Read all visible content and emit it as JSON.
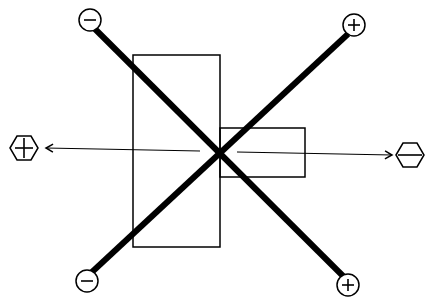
{
  "diagram": {
    "title": "",
    "elements": {
      "large_rect": {
        "x": 133,
        "y": 55,
        "w": 87,
        "h": 192
      },
      "small_rect": {
        "x": 220,
        "y": 128,
        "w": 85,
        "h": 49
      },
      "center": {
        "x": 219,
        "y": 152
      },
      "thick_lines": [
        {
          "from": "top-left",
          "to": "bottom-right",
          "start_symbol": "minus",
          "end_symbol": "plus"
        },
        {
          "from": "bottom-left",
          "to": "top-right",
          "start_symbol": "minus",
          "end_symbol": "plus"
        }
      ],
      "terminals": [
        {
          "id": "top-left",
          "shape": "circle",
          "symbol": "−",
          "x": 90,
          "y": 20
        },
        {
          "id": "top-right",
          "shape": "circle",
          "symbol": "+",
          "x": 354,
          "y": 25
        },
        {
          "id": "bottom-left",
          "shape": "circle",
          "symbol": "−",
          "x": 87,
          "y": 281
        },
        {
          "id": "bottom-right",
          "shape": "circle",
          "symbol": "+",
          "x": 348,
          "y": 285
        }
      ],
      "arrows": [
        {
          "direction": "left",
          "target_shape": "hexagon",
          "symbol": "+",
          "x": 24,
          "y": 148
        },
        {
          "direction": "right",
          "target_shape": "hexagon",
          "symbol": "−",
          "x": 410,
          "y": 155
        }
      ]
    },
    "colors": {
      "stroke": "#000000",
      "background": "#ffffff"
    }
  }
}
